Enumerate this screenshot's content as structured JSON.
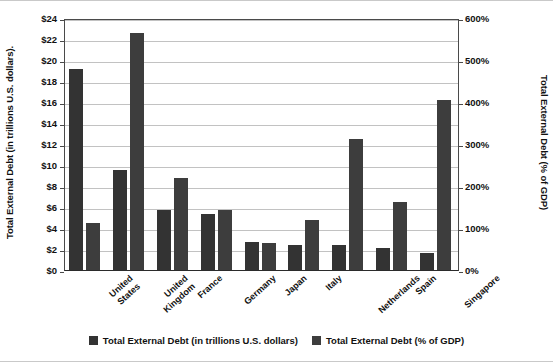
{
  "chart_data": {
    "type": "bar",
    "title": "",
    "categories": [
      "United States",
      "United Kingdom",
      "France",
      "Germany",
      "Japan",
      "Italy",
      "Netherlands",
      "Spain",
      "Singapore"
    ],
    "series": [
      {
        "name": "Total External Debt (in trillions U.S. dollars)",
        "axis": "left",
        "color": "#333333",
        "values": [
          19.1,
          9.5,
          5.7,
          5.3,
          2.7,
          2.4,
          2.4,
          2.1,
          1.6
        ]
      },
      {
        "name": "Total External Debt (% of GDP)",
        "axis": "right",
        "color": "#3d3d3d",
        "values": [
          113,
          565,
          220,
          142,
          65,
          120,
          313,
          163,
          405
        ]
      }
    ],
    "ylabel": "Total External Debt (in trillions U.S. dollars).",
    "y2label": "Total External Debt (% of GDP)",
    "xlabel": "",
    "ylim": [
      0,
      24
    ],
    "y2lim": [
      0,
      600
    ],
    "yticks": [
      "$0",
      "$2",
      "$4",
      "$6",
      "$8",
      "$10",
      "$12",
      "$14",
      "$16",
      "$18",
      "$20",
      "$22",
      "$24"
    ],
    "y2ticks": [
      "0%",
      "100%",
      "200%",
      "300%",
      "400%",
      "500%",
      "600%"
    ],
    "grid": true,
    "legend_position": "bottom"
  },
  "legend": {
    "items": [
      {
        "label": "Total External Debt (in trillions U.S. dollars)"
      },
      {
        "label": "Total External Debt (% of GDP)"
      }
    ]
  }
}
